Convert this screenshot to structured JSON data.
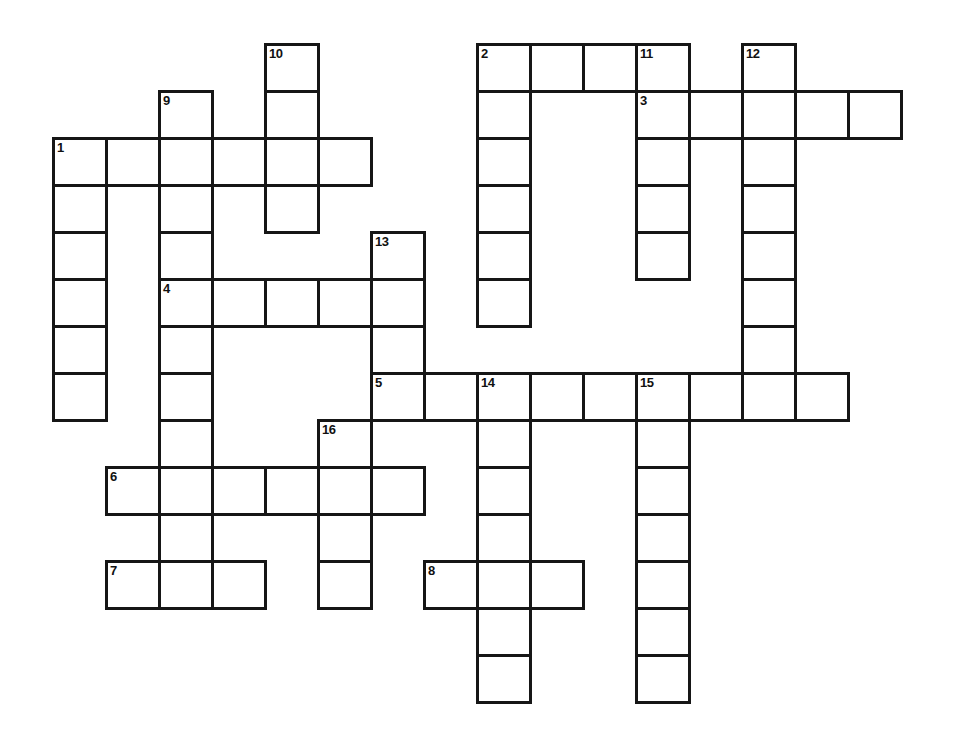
{
  "puzzle": {
    "type": "crossword",
    "grid": {
      "origin_x": 52,
      "origin_y": 43,
      "cell_width": 53,
      "cell_height": 47,
      "border_color": "#161616",
      "cell_background": "#ffffff",
      "page_background": "#ffffff"
    },
    "cells": [
      {
        "c": 4,
        "r": 0,
        "n": "10"
      },
      {
        "c": 8,
        "r": 0,
        "n": "2"
      },
      {
        "c": 9,
        "r": 0
      },
      {
        "c": 10,
        "r": 0
      },
      {
        "c": 11,
        "r": 0,
        "n": "11"
      },
      {
        "c": 13,
        "r": 0,
        "n": "12"
      },
      {
        "c": 2,
        "r": 1,
        "n": "9"
      },
      {
        "c": 4,
        "r": 1
      },
      {
        "c": 8,
        "r": 1
      },
      {
        "c": 11,
        "r": 1,
        "n": "3"
      },
      {
        "c": 12,
        "r": 1
      },
      {
        "c": 13,
        "r": 1
      },
      {
        "c": 14,
        "r": 1
      },
      {
        "c": 15,
        "r": 1
      },
      {
        "c": 0,
        "r": 2,
        "n": "1"
      },
      {
        "c": 1,
        "r": 2
      },
      {
        "c": 2,
        "r": 2
      },
      {
        "c": 3,
        "r": 2
      },
      {
        "c": 4,
        "r": 2
      },
      {
        "c": 5,
        "r": 2
      },
      {
        "c": 8,
        "r": 2
      },
      {
        "c": 11,
        "r": 2
      },
      {
        "c": 13,
        "r": 2
      },
      {
        "c": 0,
        "r": 3
      },
      {
        "c": 2,
        "r": 3
      },
      {
        "c": 4,
        "r": 3
      },
      {
        "c": 8,
        "r": 3
      },
      {
        "c": 11,
        "r": 3
      },
      {
        "c": 13,
        "r": 3
      },
      {
        "c": 0,
        "r": 4
      },
      {
        "c": 2,
        "r": 4
      },
      {
        "c": 6,
        "r": 4,
        "n": "13"
      },
      {
        "c": 8,
        "r": 4
      },
      {
        "c": 11,
        "r": 4
      },
      {
        "c": 13,
        "r": 4
      },
      {
        "c": 0,
        "r": 5
      },
      {
        "c": 2,
        "r": 5,
        "n": "4"
      },
      {
        "c": 3,
        "r": 5
      },
      {
        "c": 4,
        "r": 5
      },
      {
        "c": 5,
        "r": 5
      },
      {
        "c": 6,
        "r": 5
      },
      {
        "c": 8,
        "r": 5
      },
      {
        "c": 13,
        "r": 5
      },
      {
        "c": 0,
        "r": 6
      },
      {
        "c": 2,
        "r": 6
      },
      {
        "c": 6,
        "r": 6
      },
      {
        "c": 13,
        "r": 6
      },
      {
        "c": 0,
        "r": 7
      },
      {
        "c": 2,
        "r": 7
      },
      {
        "c": 6,
        "r": 7,
        "n": "5"
      },
      {
        "c": 7,
        "r": 7
      },
      {
        "c": 8,
        "r": 7,
        "n": "14"
      },
      {
        "c": 9,
        "r": 7
      },
      {
        "c": 10,
        "r": 7
      },
      {
        "c": 11,
        "r": 7,
        "n": "15"
      },
      {
        "c": 12,
        "r": 7
      },
      {
        "c": 13,
        "r": 7
      },
      {
        "c": 14,
        "r": 7
      },
      {
        "c": 2,
        "r": 8
      },
      {
        "c": 5,
        "r": 8,
        "n": "16"
      },
      {
        "c": 8,
        "r": 8
      },
      {
        "c": 11,
        "r": 8
      },
      {
        "c": 1,
        "r": 9,
        "n": "6"
      },
      {
        "c": 2,
        "r": 9
      },
      {
        "c": 3,
        "r": 9
      },
      {
        "c": 4,
        "r": 9
      },
      {
        "c": 5,
        "r": 9
      },
      {
        "c": 6,
        "r": 9
      },
      {
        "c": 8,
        "r": 9
      },
      {
        "c": 11,
        "r": 9
      },
      {
        "c": 2,
        "r": 10
      },
      {
        "c": 5,
        "r": 10
      },
      {
        "c": 8,
        "r": 10
      },
      {
        "c": 11,
        "r": 10
      },
      {
        "c": 1,
        "r": 11,
        "n": "7"
      },
      {
        "c": 2,
        "r": 11
      },
      {
        "c": 3,
        "r": 11
      },
      {
        "c": 5,
        "r": 11
      },
      {
        "c": 7,
        "r": 11,
        "n": "8"
      },
      {
        "c": 8,
        "r": 11
      },
      {
        "c": 9,
        "r": 11
      },
      {
        "c": 11,
        "r": 11
      },
      {
        "c": 8,
        "r": 12
      },
      {
        "c": 11,
        "r": 12
      },
      {
        "c": 8,
        "r": 13
      },
      {
        "c": 11,
        "r": 13
      }
    ],
    "entries": {
      "across": [
        {
          "number": "1",
          "row": 2,
          "col_start": 0,
          "length": 6
        },
        {
          "number": "2",
          "row": 0,
          "col_start": 8,
          "length": 4
        },
        {
          "number": "3",
          "row": 1,
          "col_start": 11,
          "length": 5
        },
        {
          "number": "4",
          "row": 5,
          "col_start": 2,
          "length": 5
        },
        {
          "number": "5",
          "row": 7,
          "col_start": 6,
          "length": 9
        },
        {
          "number": "6",
          "row": 9,
          "col_start": 1,
          "length": 6
        },
        {
          "number": "7",
          "row": 11,
          "col_start": 1,
          "length": 3
        },
        {
          "number": "8",
          "row": 11,
          "col_start": 7,
          "length": 3
        }
      ],
      "down": [
        {
          "number": "1",
          "col": 0,
          "row_start": 2,
          "length": 6
        },
        {
          "number": "2",
          "col": 8,
          "row_start": 0,
          "length": 6
        },
        {
          "number": "9",
          "col": 2,
          "row_start": 1,
          "length": 11
        },
        {
          "number": "10",
          "col": 4,
          "row_start": 0,
          "length": 4
        },
        {
          "number": "11",
          "col": 11,
          "row_start": 0,
          "length": 5
        },
        {
          "number": "12",
          "col": 13,
          "row_start": 0,
          "length": 8
        },
        {
          "number": "13",
          "col": 6,
          "row_start": 4,
          "length": 4
        },
        {
          "number": "14",
          "col": 8,
          "row_start": 7,
          "length": 7
        },
        {
          "number": "15",
          "col": 11,
          "row_start": 7,
          "length": 7
        },
        {
          "number": "16",
          "col": 5,
          "row_start": 8,
          "length": 4
        }
      ]
    }
  }
}
